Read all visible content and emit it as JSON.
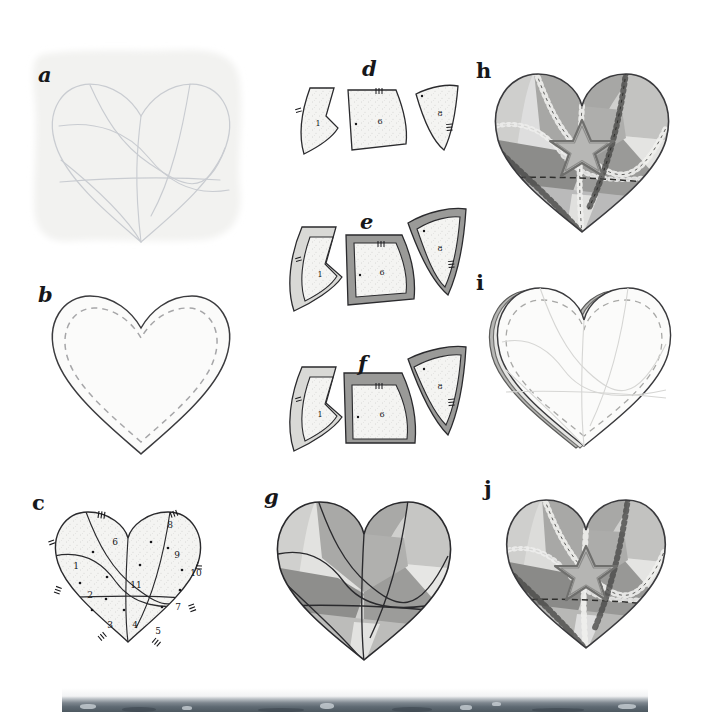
{
  "document": {
    "title": "Crazy-quilt heart construction diagram",
    "kind": "step-by-step sewing illustration",
    "panel_count": 10,
    "background_color": "#ffffff",
    "ink_color": "#17171a"
  },
  "palette": {
    "ink": "#17171a",
    "faint_draft_line": "#c9ccd1",
    "draft_paper": "#f2f2f0",
    "speckle_fill": "#f4f4f2",
    "seam_light": "#d9d9d6",
    "seam_medium": "#9a9a98",
    "tone_lightest": "#e3e3e1",
    "tone_light": "#d0d0ce",
    "tone_mid": "#b3b3b1",
    "tone_dark": "#8e8e8c",
    "tone_darkest": "#7a7a78",
    "stitch_light": "#efefed",
    "stitch_dark": "#4a4a48",
    "photo_strip": "#5f6a73"
  },
  "panels": [
    {
      "id": "a",
      "label": "a",
      "caption_hidden": "Draft the heart outline and crazy-patch seam lines on paper",
      "type": "draft-sketch",
      "has_paper_shadow": true,
      "line_style": "faint continuous",
      "heart_outline": true,
      "seam_line_count": 6
    },
    {
      "id": "b",
      "label": "b",
      "caption_hidden": "Heart shape with dashed seam allowance line inside the cut edge",
      "type": "outline-with-seam-allowance",
      "outer_line": "solid",
      "inner_line": "dashed",
      "fill": "#fbfbfa"
    },
    {
      "id": "c",
      "label": "c",
      "caption_hidden": "Number every patch and mark matching notches",
      "type": "numbered-template",
      "piece_numbers": [
        "1",
        "2",
        "3",
        "4",
        "5",
        "6",
        "7",
        "8",
        "9",
        "10",
        "11"
      ],
      "notch_marks": 8,
      "dot_marks": 12,
      "fill": "#f4f4f2"
    },
    {
      "id": "d",
      "label": "d",
      "caption_hidden": "Cut the paper templates apart",
      "type": "pieces-plain",
      "pieces": [
        {
          "number": "1",
          "notches": 1,
          "dots": 0
        },
        {
          "number": "6",
          "notches": 1,
          "dots": 1
        },
        {
          "number": "8",
          "notches": 1,
          "dots": 1
        }
      ]
    },
    {
      "id": "e",
      "label": "e",
      "caption_hidden": "Add seam allowance all around each template",
      "type": "pieces-with-allowance",
      "pieces": [
        {
          "number": "1",
          "allowance_color": "#d9d9d6",
          "notches": 1,
          "dots": 0
        },
        {
          "number": "6",
          "allowance_color": "#9a9a98",
          "notches": 1,
          "dots": 1
        },
        {
          "number": "8",
          "allowance_color": "#9a9a98",
          "notches": 1,
          "dots": 1
        }
      ]
    },
    {
      "id": "f",
      "label": "f",
      "caption_hidden": "Trim the allowance away on edges already joined",
      "type": "pieces-partial-allowance",
      "pieces": [
        {
          "number": "1",
          "allowance_color": "#d9d9d6",
          "notches": 1,
          "dots": 0
        },
        {
          "number": "6",
          "allowance_color": "#9a9a98",
          "notches": 1,
          "dots": 1
        },
        {
          "number": "8",
          "allowance_color": "#9a9a98",
          "notches": 1,
          "dots": 1
        }
      ]
    },
    {
      "id": "g",
      "label": "g",
      "caption_hidden": "All patches joined into the finished heart top",
      "type": "assembled-top",
      "patch_tones": [
        "#d7d7d5",
        "#a9a9a7",
        "#bcbcba",
        "#8e8e8c",
        "#e6e6e4",
        "#c6c6c4",
        "#9c9c9a",
        "#b0b0ae",
        "#d0d0ce",
        "#e0e0de",
        "#a0a09e"
      ]
    },
    {
      "id": "h",
      "label": "h",
      "caption_hidden": "Embroider the seams and applique the star",
      "type": "embellished-top",
      "has_star": true,
      "star_points": 5,
      "stitch_types": [
        "feather",
        "herringbone",
        "running"
      ]
    },
    {
      "id": "i",
      "label": "i",
      "caption_hidden": "Layer the top with backing and stitch, leaving an opening",
      "type": "layered-backing",
      "edge_line": "dashed",
      "layers": 3
    },
    {
      "id": "j",
      "label": "j",
      "caption_hidden": "Turn, stuff and close the finished heart",
      "type": "finished-heart",
      "has_star": true,
      "star_points": 5
    }
  ],
  "photo_strip": {
    "name": "cropped photograph edge",
    "visible": true,
    "tone": "#5f6a73"
  }
}
